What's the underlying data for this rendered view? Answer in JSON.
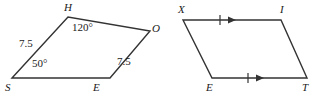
{
  "figure": {
    "background_color": "#ffffff",
    "stroke_color": "#333333",
    "text_color": "#1a1a1a",
    "shapes": [
      {
        "name": "quadrilateral-shoe",
        "type": "quadrilateral",
        "vertices": [
          {
            "label": "S",
            "x": 12,
            "y": 78
          },
          {
            "label": "H",
            "x": 68,
            "y": 17
          },
          {
            "label": "O",
            "x": 150,
            "y": 31
          },
          {
            "label": "E",
            "x": 110,
            "y": 78
          }
        ],
        "angle_labels": [
          {
            "name": "angle-h",
            "value": "120°",
            "x": 72,
            "y": 22
          },
          {
            "name": "angle-s",
            "value": "50°",
            "x": 32,
            "y": 58
          }
        ],
        "side_labels": [
          {
            "name": "side-sh-length",
            "value": "7.5",
            "x": 19,
            "y": 38
          },
          {
            "name": "side-oe-length",
            "value": "7.5",
            "x": 117,
            "y": 56
          }
        ],
        "vertex_labels": [
          {
            "name": "vertex-label-h",
            "value": "H",
            "x": 64,
            "y": 2
          },
          {
            "name": "vertex-label-o",
            "value": "O",
            "x": 152,
            "y": 23
          },
          {
            "name": "vertex-label-s",
            "value": "S",
            "x": 5,
            "y": 82
          },
          {
            "name": "vertex-label-e",
            "value": "E",
            "x": 93,
            "y": 82
          }
        ]
      },
      {
        "name": "parallelogram-xite",
        "type": "parallelogram",
        "vertices": [
          {
            "label": "X",
            "x": 183,
            "y": 20
          },
          {
            "label": "I",
            "x": 281,
            "y": 20
          },
          {
            "label": "T",
            "x": 307,
            "y": 78
          },
          {
            "label": "E",
            "x": 212,
            "y": 78
          }
        ],
        "vertex_labels": [
          {
            "name": "vertex-label-x",
            "value": "X",
            "x": 178,
            "y": 4
          },
          {
            "name": "vertex-label-i",
            "value": "I",
            "x": 280,
            "y": 4
          },
          {
            "name": "vertex-label-e2",
            "value": "E",
            "x": 206,
            "y": 82
          },
          {
            "name": "vertex-label-t",
            "value": "T",
            "x": 302,
            "y": 82
          }
        ],
        "parallel_marks": [
          {
            "name": "parallel-mark-top",
            "tick_x": 220,
            "arrow_x": 228,
            "y": 20
          },
          {
            "name": "parallel-mark-bottom",
            "tick_x": 248,
            "arrow_x": 256,
            "y": 78
          }
        ]
      }
    ]
  }
}
